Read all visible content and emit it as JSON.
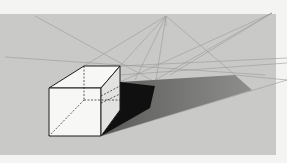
{
  "figure": {
    "colors": {
      "page": "#f4f4f2",
      "backdrop": "#c9c9c7",
      "construction_line": "#9a9a98",
      "cube_face": "#f7f7f5",
      "cube_edge": "#1e1e1e",
      "shadow_dark": "#101010",
      "shadow_mid": "#6e6e6c",
      "shadow_light": "#8a8a88"
    },
    "vanishing_points": [
      {
        "name": "light-source",
        "x": 166,
        "y": 16
      },
      {
        "name": "right-vp",
        "x": 272,
        "y": 13
      }
    ]
  }
}
